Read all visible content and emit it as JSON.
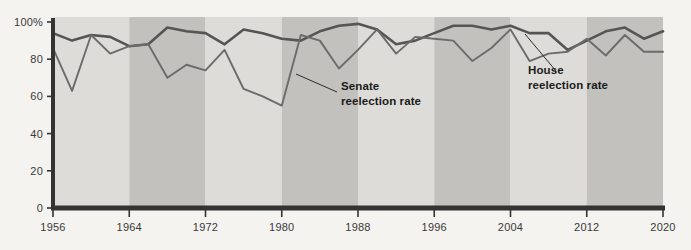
{
  "chart_data": {
    "type": "line",
    "title": "",
    "subtitle": "",
    "xlabel": "",
    "ylabel": "",
    "xlim": [
      1956,
      2020
    ],
    "ylim": [
      0,
      100
    ],
    "grid": false,
    "legend_position": "inline-annotations",
    "x_tick_labels": [
      "1956",
      "1964",
      "1972",
      "1980",
      "1988",
      "1996",
      "2004",
      "2012",
      "2020"
    ],
    "x_ticks": [
      1956,
      1964,
      1972,
      1980,
      1988,
      1996,
      2004,
      2012,
      2020
    ],
    "y_tick_labels": [
      "0",
      "20",
      "40",
      "60",
      "80",
      "100%"
    ],
    "y_ticks": [
      0,
      20,
      40,
      60,
      80,
      100
    ],
    "x": [
      1956,
      1958,
      1960,
      1962,
      1964,
      1966,
      1968,
      1970,
      1972,
      1974,
      1976,
      1978,
      1980,
      1982,
      1984,
      1986,
      1988,
      1990,
      1992,
      1994,
      1996,
      1998,
      2000,
      2002,
      2004,
      2006,
      2008,
      2010,
      2012,
      2014,
      2016,
      2018,
      2020
    ],
    "series": [
      {
        "name": "House reelection rate",
        "color": "#555555",
        "values": [
          94,
          90,
          93,
          92,
          87,
          88,
          97,
          95,
          94,
          88,
          96,
          94,
          91,
          90,
          95,
          98,
          99,
          96,
          88,
          90,
          94,
          98,
          98,
          96,
          98,
          94,
          94,
          85,
          90,
          95,
          97,
          91,
          95
        ]
      },
      {
        "name": "Senate reelection rate",
        "color": "#6b6b6b",
        "values": [
          86,
          63,
          93,
          83,
          87,
          88,
          70,
          77,
          74,
          85,
          64,
          60,
          55,
          93,
          90,
          75,
          85,
          96,
          83,
          92,
          91,
          90,
          79,
          86,
          96,
          79,
          83,
          84,
          91,
          82,
          93,
          84,
          84
        ]
      }
    ],
    "annotations": [
      {
        "label_line1": "Senate",
        "label_line2": "reelection rate",
        "target_series": "Senate reelection rate"
      },
      {
        "label_line1": "House",
        "label_line2": "reelection rate",
        "target_series": "House reelection rate"
      }
    ],
    "background_bands": {
      "note": "alternating 8-year shaded vertical bands",
      "light": "#dedcd8",
      "dark": "#c2c1bd"
    },
    "axis_color": "#333333",
    "page_background": "#f4f3ef"
  }
}
